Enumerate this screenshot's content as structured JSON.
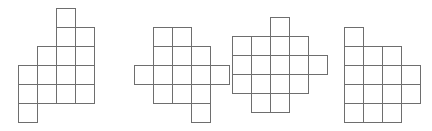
{
  "figure": {
    "background_color": "#ffffff",
    "stroke_color": "#6e6e6e",
    "cell_fill_color": "#ffffff",
    "stroke_width": 1,
    "cell_size": 19,
    "canvas": {
      "width": 432,
      "height": 131
    },
    "shape_count": 4,
    "cells_per_shape": 6
  },
  "shapes": [
    {
      "label": "net-1",
      "name": "hexomino-net-1",
      "origin": {
        "x": 18,
        "y": 8
      },
      "cols": 4,
      "rows": 6,
      "cells": [
        {
          "col": 2,
          "row": 0
        },
        {
          "col": 2,
          "row": 1
        },
        {
          "col": 3,
          "row": 1
        },
        {
          "col": 1,
          "row": 2
        },
        {
          "col": 2,
          "row": 2
        },
        {
          "col": 3,
          "row": 2
        },
        {
          "col": 0,
          "row": 3
        },
        {
          "col": 1,
          "row": 3
        },
        {
          "col": 2,
          "row": 3
        },
        {
          "col": 3,
          "row": 3
        },
        {
          "col": 0,
          "row": 4
        },
        {
          "col": 1,
          "row": 4
        },
        {
          "col": 2,
          "row": 4
        },
        {
          "col": 3,
          "row": 4
        },
        {
          "col": 0,
          "row": 5
        }
      ]
    },
    {
      "label": "net-2",
      "name": "hexomino-net-2",
      "origin": {
        "x": 134,
        "y": 27
      },
      "cols": 5,
      "rows": 5,
      "cells": [
        {
          "col": 1,
          "row": 0
        },
        {
          "col": 2,
          "row": 0
        },
        {
          "col": 1,
          "row": 1
        },
        {
          "col": 2,
          "row": 1
        },
        {
          "col": 3,
          "row": 1
        },
        {
          "col": 0,
          "row": 2
        },
        {
          "col": 1,
          "row": 2
        },
        {
          "col": 2,
          "row": 2
        },
        {
          "col": 3,
          "row": 2
        },
        {
          "col": 4,
          "row": 2
        },
        {
          "col": 1,
          "row": 3
        },
        {
          "col": 2,
          "row": 3
        },
        {
          "col": 3,
          "row": 3
        },
        {
          "col": 3,
          "row": 4
        }
      ]
    },
    {
      "label": "net-3",
      "name": "hexomino-net-3",
      "origin": {
        "x": 232,
        "y": 17
      },
      "cols": 5,
      "rows": 5,
      "cells": [
        {
          "col": 2,
          "row": 0
        },
        {
          "col": 0,
          "row": 1
        },
        {
          "col": 1,
          "row": 1
        },
        {
          "col": 2,
          "row": 1
        },
        {
          "col": 3,
          "row": 1
        },
        {
          "col": 0,
          "row": 2
        },
        {
          "col": 1,
          "row": 2
        },
        {
          "col": 2,
          "row": 2
        },
        {
          "col": 3,
          "row": 2
        },
        {
          "col": 4,
          "row": 2
        },
        {
          "col": 0,
          "row": 3
        },
        {
          "col": 1,
          "row": 3
        },
        {
          "col": 2,
          "row": 3
        },
        {
          "col": 3,
          "row": 3
        },
        {
          "col": 1,
          "row": 4
        },
        {
          "col": 2,
          "row": 4
        }
      ]
    },
    {
      "label": "net-4",
      "name": "hexomino-net-4",
      "origin": {
        "x": 344,
        "y": 27
      },
      "cols": 4,
      "rows": 5,
      "cells": [
        {
          "col": 0,
          "row": 0
        },
        {
          "col": 0,
          "row": 1
        },
        {
          "col": 1,
          "row": 1
        },
        {
          "col": 2,
          "row": 1
        },
        {
          "col": 0,
          "row": 2
        },
        {
          "col": 1,
          "row": 2
        },
        {
          "col": 2,
          "row": 2
        },
        {
          "col": 3,
          "row": 2
        },
        {
          "col": 0,
          "row": 3
        },
        {
          "col": 1,
          "row": 3
        },
        {
          "col": 2,
          "row": 3
        },
        {
          "col": 3,
          "row": 3
        },
        {
          "col": 0,
          "row": 4
        },
        {
          "col": 1,
          "row": 4
        },
        {
          "col": 2,
          "row": 4
        }
      ]
    }
  ]
}
